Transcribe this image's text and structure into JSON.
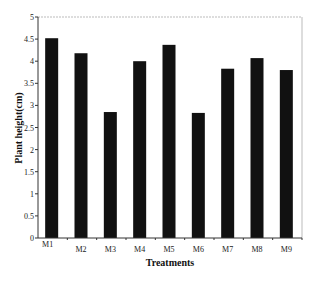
{
  "chart_data": {
    "type": "bar",
    "title": "",
    "xlabel": "Treatments",
    "ylabel": "Plant height(cm)",
    "categories": [
      "M1",
      "M2",
      "M3",
      "M4",
      "M5",
      "M6",
      "M7",
      "M8",
      "M9"
    ],
    "values": [
      4.52,
      4.18,
      2.85,
      4.0,
      4.37,
      2.83,
      3.83,
      4.07,
      3.8
    ],
    "ylim": [
      0,
      5
    ],
    "yticks": [
      "0",
      "0.5",
      "1",
      "1.5",
      "2",
      "2.5",
      "3",
      "3.5",
      "4",
      "4.5",
      "5"
    ],
    "grid": false,
    "legend": null,
    "bar_color": "#111111",
    "frame_color": "#bbbbbb"
  }
}
